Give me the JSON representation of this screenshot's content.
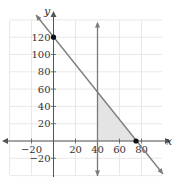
{
  "chart_data": {
    "type": "line",
    "title": "",
    "xlabel": "x",
    "ylabel": "y",
    "xlim": [
      -30,
      100
    ],
    "ylim": [
      -40,
      140
    ],
    "grid": true,
    "x_ticks": [
      -20,
      20,
      40,
      60,
      80
    ],
    "y_ticks": [
      -20,
      20,
      40,
      60,
      80,
      100,
      120
    ],
    "x_tick_labels": [
      "−20",
      "20",
      "40",
      "60",
      "80"
    ],
    "y_tick_labels": [
      "−20",
      "20",
      "40",
      "60",
      "80",
      "100",
      "120"
    ],
    "series": [
      {
        "name": "boundary line",
        "equation": "y = 120 - 1.6x",
        "points": [
          [
            -15,
            144
          ],
          [
            100,
            -40
          ]
        ],
        "color": "#7a7a7a",
        "arrows": "both"
      },
      {
        "name": "vertical line",
        "equation": "x = 40",
        "points": [
          [
            40,
            136
          ],
          [
            40,
            -40
          ]
        ],
        "color": "#7a7a7a",
        "arrows": "both"
      }
    ],
    "points": [
      {
        "label": "y-intercept",
        "x": 0,
        "y": 120
      },
      {
        "label": "x-intercept",
        "x": 75,
        "y": 0
      }
    ],
    "shaded_region": {
      "description": "region bounded by x = 40, y = 0, and y = 120 - 1.6x",
      "vertices": [
        [
          40,
          0
        ],
        [
          40,
          56
        ],
        [
          75,
          0
        ]
      ],
      "color": "#e6e6e6"
    }
  },
  "axis_labels": {
    "x": "x",
    "y": "y"
  }
}
